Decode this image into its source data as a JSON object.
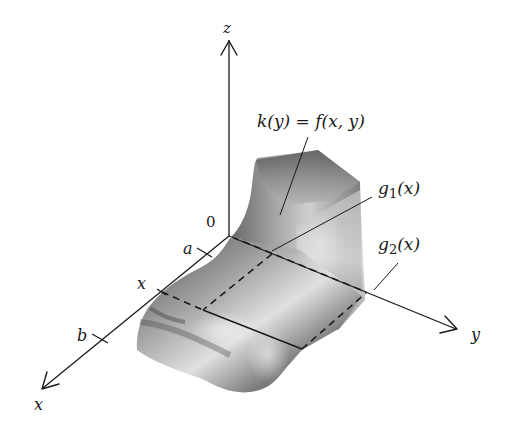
{
  "figure": {
    "axes": {
      "z_label": "z",
      "x_label": "x",
      "y_label": "y",
      "origin_label": "0"
    },
    "x_ticks": {
      "a": "a",
      "x": "x",
      "b": "b"
    },
    "annotations": {
      "cross_section": "k(y) = f(x, y)",
      "g1": {
        "base": "g",
        "sub": "1",
        "arg": "(x)"
      },
      "g2": {
        "base": "g",
        "sub": "2",
        "arg": "(x)"
      }
    },
    "colors": {
      "ink": "#1a1a1a",
      "solid_dark": "#4a4a4a",
      "solid_mid": "#8a8a8a",
      "solid_light": "#d8d8d8",
      "background": "#ffffff"
    }
  }
}
